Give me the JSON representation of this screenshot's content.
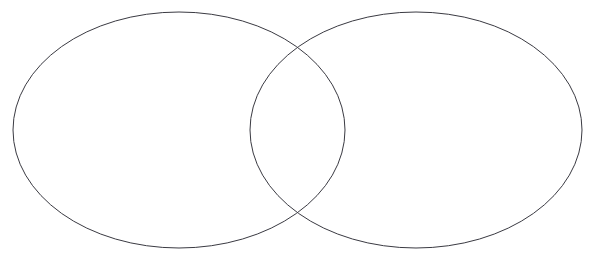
{
  "canvas": {
    "width": 593,
    "height": 259,
    "background_color": "#ffffff"
  },
  "diagram": {
    "type": "venn",
    "set_count": 2,
    "stroke_color": "#3a3a42",
    "stroke_width": 1,
    "fill": "none",
    "labels_visible": false,
    "shapes": [
      {
        "name": "left-set",
        "shape": "ellipse",
        "cx": 179,
        "cy": 130,
        "rx": 166,
        "ry": 118,
        "label": "",
        "fill": "none",
        "stroke_color": "#3a3a42"
      },
      {
        "name": "right-set",
        "shape": "ellipse",
        "cx": 416,
        "cy": 130,
        "rx": 166,
        "ry": 118,
        "label": "",
        "fill": "none",
        "stroke_color": "#3a3a42"
      }
    ],
    "intersections": [
      {
        "name": "upper-crossing",
        "x": 297,
        "y": 48
      },
      {
        "name": "lower-crossing",
        "x": 298,
        "y": 214
      }
    ],
    "regions": [
      {
        "name": "left-only",
        "label": "",
        "cx": 150,
        "cy": 130
      },
      {
        "name": "overlap",
        "label": "",
        "cx": 298,
        "cy": 130
      },
      {
        "name": "right-only",
        "label": "",
        "cx": 445,
        "cy": 130
      }
    ]
  },
  "artifacts": {
    "top_clipped_text": "",
    "note": ""
  }
}
